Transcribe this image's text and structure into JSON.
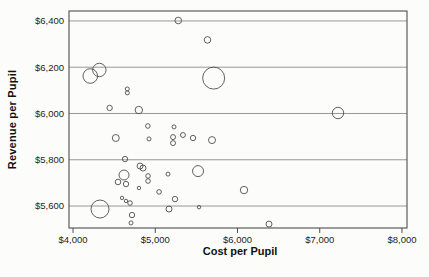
{
  "figure": {
    "background": "#fcfcfa",
    "stroke_color": "#4f4f4f",
    "grid_color": "#878787",
    "text_color": "#1c1c1c"
  },
  "chart_data": {
    "type": "scatter",
    "subtype": "bubble",
    "title": "",
    "xlabel": "Cost per Pupil",
    "ylabel": "Revenue per Pupil",
    "xlim": [
      3951,
      8061
    ],
    "ylim": [
      5505,
      6443
    ],
    "grid": "horizontal-only",
    "legend": "none",
    "x_ticks": [
      {
        "value": 4000,
        "label": "$4,000"
      },
      {
        "value": 5000,
        "label": "$5,000"
      },
      {
        "value": 6000,
        "label": "$6,000"
      },
      {
        "value": 7000,
        "label": "$7,000"
      },
      {
        "value": 8000,
        "label": "$8,000"
      }
    ],
    "y_ticks": [
      {
        "value": 5600,
        "label": "$5,600"
      },
      {
        "value": 5800,
        "label": "$5,800"
      },
      {
        "value": 6000,
        "label": "$6,000"
      },
      {
        "value": 6200,
        "label": "$6,200"
      },
      {
        "value": 6400,
        "label": "$6,400"
      }
    ],
    "size_unit": "bubble radius in px, varies by point",
    "points": [
      {
        "cost": 5280,
        "revenue": 6402,
        "size": 3.3
      },
      {
        "cost": 5635,
        "revenue": 6318,
        "size": 3.3
      },
      {
        "cost": 4210,
        "revenue": 6162,
        "size": 7.3
      },
      {
        "cost": 4320,
        "revenue": 6188,
        "size": 6.7
      },
      {
        "cost": 5710,
        "revenue": 6153,
        "size": 11
      },
      {
        "cost": 4660,
        "revenue": 6106,
        "size": 2
      },
      {
        "cost": 4660,
        "revenue": 6089,
        "size": 2
      },
      {
        "cost": 4445,
        "revenue": 6024,
        "size": 2.7
      },
      {
        "cost": 4800,
        "revenue": 6015,
        "size": 3.7
      },
      {
        "cost": 4910,
        "revenue": 5946,
        "size": 2.3
      },
      {
        "cost": 5228,
        "revenue": 5942,
        "size": 2
      },
      {
        "cost": 7222,
        "revenue": 6002,
        "size": 5.7
      },
      {
        "cost": 4520,
        "revenue": 5894,
        "size": 3.5
      },
      {
        "cost": 4924,
        "revenue": 5890,
        "size": 2
      },
      {
        "cost": 5216,
        "revenue": 5898,
        "size": 2.5
      },
      {
        "cost": 5216,
        "revenue": 5872,
        "size": 2.5
      },
      {
        "cost": 5337,
        "revenue": 5907,
        "size": 2.5
      },
      {
        "cost": 5459,
        "revenue": 5894,
        "size": 2.7
      },
      {
        "cost": 5690,
        "revenue": 5885,
        "size": 3.5
      },
      {
        "cost": 4632,
        "revenue": 5803,
        "size": 2.7
      },
      {
        "cost": 4815,
        "revenue": 5773,
        "size": 3
      },
      {
        "cost": 4851,
        "revenue": 5764,
        "size": 3
      },
      {
        "cost": 4620,
        "revenue": 5734,
        "size": 5
      },
      {
        "cost": 4547,
        "revenue": 5704,
        "size": 2.8
      },
      {
        "cost": 4644,
        "revenue": 5695,
        "size": 2.7
      },
      {
        "cost": 4912,
        "revenue": 5730,
        "size": 2.3
      },
      {
        "cost": 4912,
        "revenue": 5708,
        "size": 2.3
      },
      {
        "cost": 5155,
        "revenue": 5738,
        "size": 2
      },
      {
        "cost": 5520,
        "revenue": 5751,
        "size": 5.5
      },
      {
        "cost": 4802,
        "revenue": 5678,
        "size": 1.7
      },
      {
        "cost": 5046,
        "revenue": 5661,
        "size": 2.3
      },
      {
        "cost": 4596,
        "revenue": 5635,
        "size": 1.7
      },
      {
        "cost": 4644,
        "revenue": 5622,
        "size": 1.7
      },
      {
        "cost": 4693,
        "revenue": 5613,
        "size": 2.3
      },
      {
        "cost": 4328,
        "revenue": 5587,
        "size": 9
      },
      {
        "cost": 4717,
        "revenue": 5561,
        "size": 2.7
      },
      {
        "cost": 4705,
        "revenue": 5527,
        "size": 2
      },
      {
        "cost": 5167,
        "revenue": 5587,
        "size": 3
      },
      {
        "cost": 5240,
        "revenue": 5630,
        "size": 2.7
      },
      {
        "cost": 5532,
        "revenue": 5595,
        "size": 1.7
      },
      {
        "cost": 6079,
        "revenue": 5669,
        "size": 3.7
      },
      {
        "cost": 6383,
        "revenue": 5522,
        "size": 3
      }
    ]
  }
}
